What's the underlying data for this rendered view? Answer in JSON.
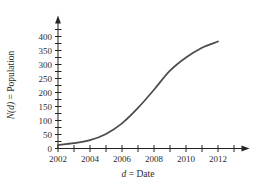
{
  "chart_data": {
    "type": "line",
    "title": "",
    "xlabel_italic": "d",
    "xlabel_rest": " = Date",
    "ylabel_italic": "N(d)",
    "ylabel_rest": " = Population",
    "x": [
      2002,
      2003,
      2004,
      2005,
      2006,
      2007,
      2008,
      2009,
      2010,
      2011,
      2012
    ],
    "values": [
      13,
      19,
      30,
      52,
      90,
      145,
      210,
      278,
      325,
      360,
      382
    ],
    "x_ticks": [
      2002,
      2003,
      2004,
      2005,
      2006,
      2007,
      2008,
      2009,
      2010,
      2011,
      2012,
      2013
    ],
    "x_tick_labels": [
      "2002",
      "2004",
      "2006",
      "2008",
      "2010",
      "2012"
    ],
    "x_label_positions": [
      2002,
      2004,
      2006,
      2008,
      2010,
      2012
    ],
    "y_ticks": [
      0,
      25,
      50,
      75,
      100,
      125,
      150,
      175,
      200,
      225,
      250,
      275,
      300,
      325,
      350,
      375,
      400,
      425
    ],
    "y_tick_labels": [
      "0",
      "50",
      "100",
      "150",
      "200",
      "250",
      "300",
      "350",
      "400"
    ],
    "y_label_positions": [
      0,
      50,
      100,
      150,
      200,
      250,
      300,
      350,
      400
    ],
    "xlim": [
      2002,
      2013.8
    ],
    "ylim": [
      0,
      455
    ],
    "grid": false,
    "legend": null,
    "curve_color": "#4d4b4a",
    "axis_color": "#262422",
    "text_color": "#2e2c2b"
  }
}
